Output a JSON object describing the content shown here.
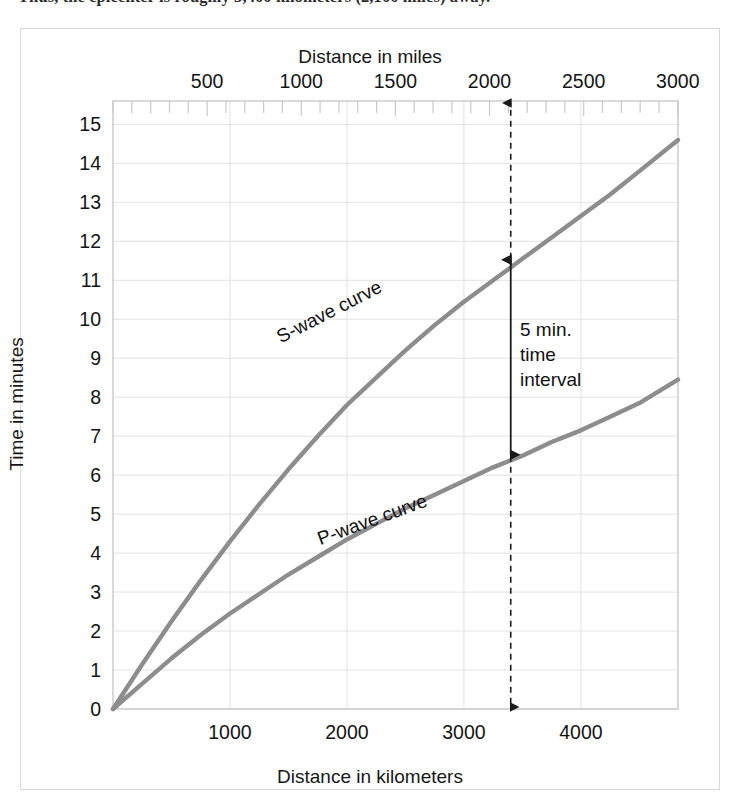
{
  "caption": {
    "text": "Thus, the epicenter is roughly 3,400 kilometers (2,100 miles) away."
  },
  "figure": {
    "top_axis_title": "Distance in miles",
    "bottom_axis_title": "Distance in kilometers",
    "y_axis_title": "Time in minutes",
    "s_wave_label": "S-wave curve",
    "p_wave_label": "P-wave curve",
    "annotation_line1": "5 min.",
    "annotation_line2": "time",
    "annotation_line3": "interval"
  },
  "colors": {
    "curve": "#8d8d8d",
    "gridline": "#e2e2e2",
    "frame": "#c9c9c9",
    "annotation": "#1a1a1a",
    "panel_border": "#d8d8d8",
    "text": "#141414"
  },
  "chart_data": {
    "type": "line",
    "xlabel": "Distance in kilometers",
    "ylabel": "Time in minutes",
    "secondary_xlabel": "Distance in miles",
    "xlim": [
      0,
      4830
    ],
    "ylim": [
      0,
      15.6
    ],
    "secondary_xlim": [
      0,
      3001
    ],
    "grid": true,
    "legend": "inline-curve-labels",
    "x_ticks": [
      1000,
      2000,
      3000,
      4000
    ],
    "x_tick_labels": [
      "1000",
      "2000",
      "3000",
      "4000"
    ],
    "secondary_x_ticks": [
      500,
      1000,
      1500,
      2000,
      2500,
      3000
    ],
    "secondary_x_tick_labels": [
      "500",
      "1000",
      "1500",
      "2000",
      "2500",
      "3000"
    ],
    "secondary_x_minor_tick_step": 100,
    "y_ticks": [
      0,
      1,
      2,
      3,
      4,
      5,
      6,
      7,
      8,
      9,
      10,
      11,
      12,
      13,
      14,
      15
    ],
    "y_tick_labels": [
      "0",
      "1",
      "2",
      "3",
      "4",
      "5",
      "6",
      "7",
      "8",
      "9",
      "10",
      "11",
      "12",
      "13",
      "14",
      "15"
    ],
    "series": [
      {
        "name": "S-wave curve",
        "color": "#8d8d8d",
        "x": [
          0,
          250,
          500,
          750,
          1000,
          1250,
          1500,
          1750,
          2000,
          2250,
          2500,
          2750,
          3000,
          3250,
          3500,
          3750,
          4000,
          4250,
          4500,
          4830
        ],
        "y": [
          0.0,
          1.15,
          2.25,
          3.3,
          4.3,
          5.25,
          6.15,
          7.0,
          7.8,
          8.5,
          9.2,
          9.85,
          10.45,
          11.0,
          11.55,
          12.1,
          12.65,
          13.2,
          13.8,
          14.6
        ]
      },
      {
        "name": "P-wave curve",
        "color": "#8d8d8d",
        "x": [
          0,
          250,
          500,
          750,
          1000,
          1250,
          1500,
          1750,
          2000,
          2250,
          2500,
          2750,
          3000,
          3250,
          3500,
          3750,
          4000,
          4250,
          4500,
          4830
        ],
        "y": [
          0.0,
          0.65,
          1.3,
          1.9,
          2.45,
          2.95,
          3.45,
          3.9,
          4.35,
          4.75,
          5.15,
          5.5,
          5.85,
          6.2,
          6.5,
          6.85,
          7.15,
          7.5,
          7.85,
          8.45
        ]
      }
    ],
    "annotations": [
      {
        "name": "time-interval-marker",
        "label": "5 min. time interval",
        "x": 3400,
        "y_top": 11.55,
        "y_bottom": 6.5,
        "interval_minutes": 5,
        "style": "double-headed-arrow"
      },
      {
        "name": "epicenter-distance-dropline",
        "x": 3400,
        "style": "dashed-vertical-line-with-arrowheads",
        "extends_from": "top-axis",
        "extends_to": "bottom-axis"
      }
    ]
  }
}
